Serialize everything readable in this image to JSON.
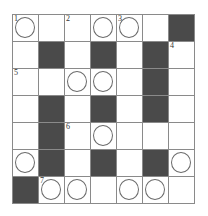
{
  "puzzle": {
    "rows": 7,
    "cols": 7,
    "colors": {
      "black": "#4a4a4a",
      "line": "#8a8a8a",
      "circle": "#6a6a6a"
    },
    "cells": [
      [
        {
          "t": "w",
          "c": true,
          "n": "1"
        },
        {
          "t": "w"
        },
        {
          "t": "w",
          "n": "2"
        },
        {
          "t": "w",
          "c": true
        },
        {
          "t": "w",
          "c": true,
          "n": "3"
        },
        {
          "t": "w"
        },
        {
          "t": "b"
        }
      ],
      [
        {
          "t": "w"
        },
        {
          "t": "b"
        },
        {
          "t": "w"
        },
        {
          "t": "b"
        },
        {
          "t": "w"
        },
        {
          "t": "b"
        },
        {
          "t": "w",
          "n": "4"
        }
      ],
      [
        {
          "t": "w",
          "n": "5"
        },
        {
          "t": "w"
        },
        {
          "t": "w",
          "c": true
        },
        {
          "t": "w",
          "c": true
        },
        {
          "t": "w"
        },
        {
          "t": "b"
        },
        {
          "t": "w"
        }
      ],
      [
        {
          "t": "w"
        },
        {
          "t": "b"
        },
        {
          "t": "w"
        },
        {
          "t": "b"
        },
        {
          "t": "w"
        },
        {
          "t": "b"
        },
        {
          "t": "w"
        }
      ],
      [
        {
          "t": "w"
        },
        {
          "t": "b"
        },
        {
          "t": "w",
          "n": "6"
        },
        {
          "t": "w",
          "c": true
        },
        {
          "t": "w"
        },
        {
          "t": "w"
        },
        {
          "t": "w"
        }
      ],
      [
        {
          "t": "w",
          "c": true
        },
        {
          "t": "b"
        },
        {
          "t": "w"
        },
        {
          "t": "b"
        },
        {
          "t": "w"
        },
        {
          "t": "b"
        },
        {
          "t": "w",
          "c": true
        }
      ],
      [
        {
          "t": "b"
        },
        {
          "t": "w",
          "c": true,
          "n": "7"
        },
        {
          "t": "w",
          "c": true
        },
        {
          "t": "w"
        },
        {
          "t": "w",
          "c": true
        },
        {
          "t": "w",
          "c": true
        },
        {
          "t": "w"
        }
      ]
    ]
  }
}
